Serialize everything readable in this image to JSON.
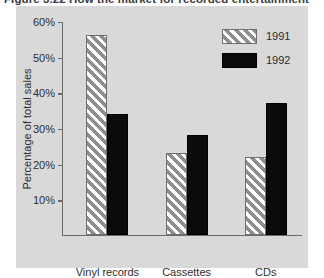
{
  "caption": "Figure 3.22  How the market for recorded entertainment",
  "colors": {
    "panel_background": "#d9d9d9",
    "page_background": "#ffffff",
    "axis": "#6b6b6b",
    "text": "#2e2e2e",
    "bar_1991_hatch": "#8e8e8e",
    "bar_1992_fill": "#0b0b0b"
  },
  "chart_data": {
    "type": "bar",
    "title": "",
    "xlabel": "",
    "ylabel": "Percentage of total sales",
    "categories": [
      "Vinyl records",
      "Cassettes",
      "CDs"
    ],
    "series": [
      {
        "name": "1991",
        "values": [
          56,
          23,
          22
        ]
      },
      {
        "name": "1992",
        "values": [
          34,
          28,
          37
        ]
      }
    ],
    "ylim": [
      0,
      60
    ],
    "yticks": [
      10,
      20,
      30,
      40,
      50,
      60
    ],
    "ytick_labels": [
      "10%",
      "20%",
      "30%",
      "40%",
      "50%",
      "60%"
    ],
    "grid": false,
    "legend_position": "top-right"
  }
}
